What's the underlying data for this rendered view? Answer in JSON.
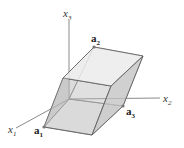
{
  "diagram": {
    "type": "parallelepiped",
    "colors": {
      "axis": "#8a8a8a",
      "edge": "#5a5a5a",
      "face_light": "#e8e8e8",
      "face_top": "#ececec",
      "face_side": "#c8c8c8",
      "face_left": "#bdbdbd",
      "vertex_dot": "#777777"
    },
    "axes": [
      {
        "name": "x1",
        "base": "x",
        "sub": "1"
      },
      {
        "name": "x2",
        "base": "x",
        "sub": "2"
      },
      {
        "name": "x3",
        "base": "x",
        "sub": "3"
      }
    ],
    "vectors": [
      {
        "name": "a1",
        "base": "a",
        "sub": "1"
      },
      {
        "name": "a2",
        "base": "a",
        "sub": "2"
      },
      {
        "name": "a3",
        "base": "a",
        "sub": "3"
      }
    ]
  }
}
